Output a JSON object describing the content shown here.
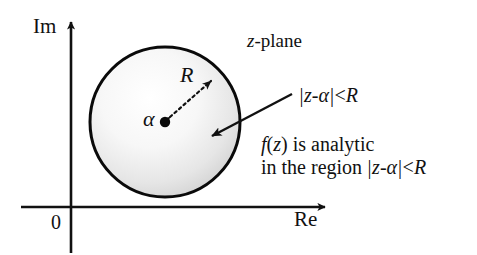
{
  "figure": {
    "background_color": "#ffffff",
    "ink_color": "#111111",
    "disc_fill_light": "#fdfdfd",
    "disc_fill_dark": "#c9c9c9"
  },
  "axes": {
    "imaginary_label": "Im",
    "real_label": "Re",
    "origin_label": "0"
  },
  "plane": {
    "label_italic": "z",
    "label_rest": "-plane"
  },
  "disc": {
    "center_label": "α",
    "radius_label": "R",
    "center_point": {
      "x": 165,
      "y": 122
    },
    "radius_px": 75
  },
  "callout": {
    "formula": {
      "open_bar": "|",
      "z": "z",
      "minus": "-",
      "alpha": "α",
      "close_bar": "|",
      "lt": "<",
      "R": "R"
    },
    "formula_plain": "|z-α|<R"
  },
  "note": {
    "line1": {
      "f": "f",
      "paren_open": "(",
      "z": "z",
      "paren_close": ")",
      "rest": " is analytic"
    },
    "line1_plain": "f(z) is analytic",
    "line2": {
      "prefix": "in the region ",
      "open_bar": "|",
      "z": "z",
      "minus": "-",
      "alpha": "α",
      "close_bar": "|",
      "lt": "<",
      "R": "R"
    },
    "line2_plain": "in the region |z-α|<R"
  }
}
